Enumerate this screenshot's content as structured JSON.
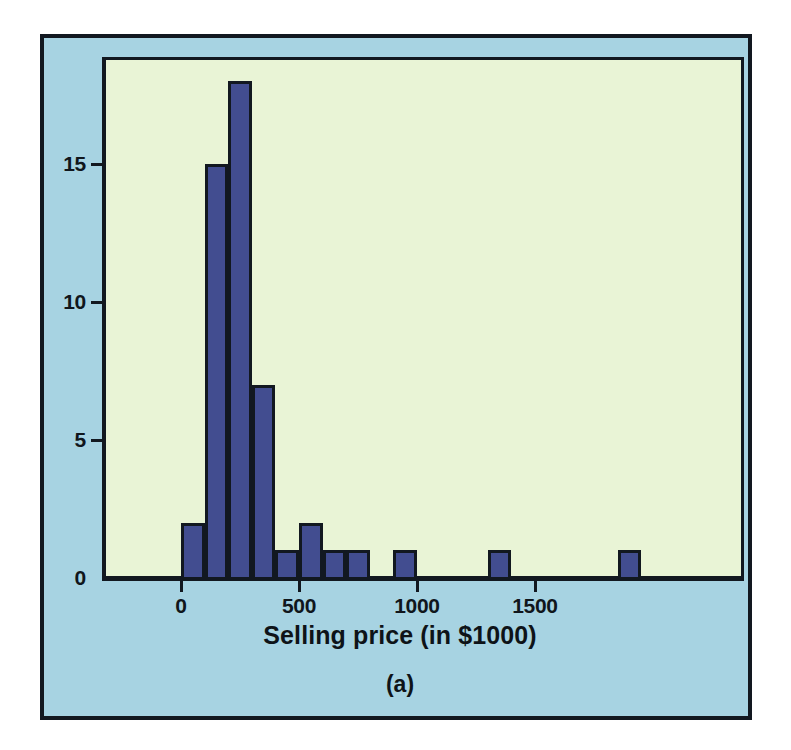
{
  "figure": {
    "caption": "(a)",
    "panel_bg": "#a7d3e2",
    "plot_bg": "#e9f4d6",
    "border_color": "#121820",
    "bar_color": "#424d90"
  },
  "chart_data": {
    "type": "bar",
    "title": "",
    "subtitle": "",
    "xlabel": "Selling price (in $1000)",
    "ylabel": "",
    "annotations": [
      "(a)"
    ],
    "legend": [],
    "legend_position": "none",
    "grid": false,
    "bin_width": 100,
    "xlim": [
      -120,
      2130
    ],
    "ylim": [
      0,
      19.6
    ],
    "xticks": [
      0,
      500,
      1000,
      1500
    ],
    "xticklabels": [
      "0",
      "500",
      "1000",
      "1500"
    ],
    "yticks": [
      0,
      5,
      10,
      15
    ],
    "yticklabels": [
      "0",
      "5",
      "10",
      "15"
    ],
    "categories": [
      "0-100",
      "100-200",
      "200-300",
      "300-400",
      "400-500",
      "500-600",
      "600-700",
      "700-800",
      "900-1000",
      "1300-1400",
      "1850-1950"
    ],
    "bins": [
      {
        "label": "0-100",
        "start": 0,
        "end": 100,
        "count": 2
      },
      {
        "label": "100-200",
        "start": 100,
        "end": 200,
        "count": 15
      },
      {
        "label": "200-300",
        "start": 200,
        "end": 300,
        "count": 18
      },
      {
        "label": "300-400",
        "start": 300,
        "end": 400,
        "count": 7
      },
      {
        "label": "400-500",
        "start": 400,
        "end": 500,
        "count": 1
      },
      {
        "label": "500-600",
        "start": 500,
        "end": 600,
        "count": 2
      },
      {
        "label": "600-700",
        "start": 600,
        "end": 700,
        "count": 1
      },
      {
        "label": "700-800",
        "start": 700,
        "end": 800,
        "count": 1
      },
      {
        "label": "900-1000",
        "start": 900,
        "end": 1000,
        "count": 1
      },
      {
        "label": "1300-1400",
        "start": 1300,
        "end": 1400,
        "count": 1
      },
      {
        "label": "1850-1950",
        "start": 1850,
        "end": 1950,
        "count": 1
      }
    ],
    "values": [
      2,
      15,
      18,
      7,
      1,
      2,
      1,
      1,
      1,
      1,
      1
    ]
  }
}
